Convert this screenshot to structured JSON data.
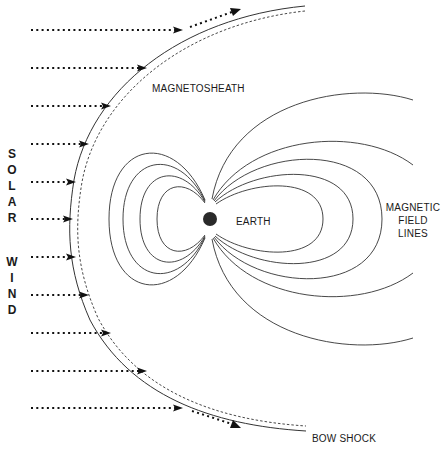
{
  "labels": {
    "magnetosheath": "MAGNETOSHEATH",
    "earth": "EARTH",
    "field_lines": [
      "MAGNETIC",
      "FIELD",
      "LINES"
    ],
    "bow_shock": "BOW SHOCK",
    "solar_wind_letters": [
      "S",
      "O",
      "L",
      "A",
      "R",
      "",
      "W",
      "I",
      "N",
      "D"
    ]
  },
  "colors": {
    "line": "#333333",
    "earth": "#2a2a2a",
    "text": "#1a1a1a"
  },
  "elements": {
    "solar_wind_arrows": 11,
    "deflected_arrows": 2,
    "dayside_closed_field_lines": 4,
    "nightside_closed_field_lines": 3,
    "nightside_open_field_lines": 2
  }
}
